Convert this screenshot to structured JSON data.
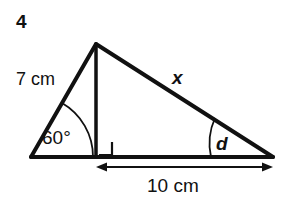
{
  "figure": {
    "question_number": "4",
    "type": "triangle-with-altitude",
    "stroke_color": "#111111",
    "background_color": "#ffffff",
    "labels": {
      "left_side": "7 cm",
      "left_angle": "60°",
      "right_side": "x",
      "right_angle": "d",
      "base_segment": "10 cm"
    },
    "geometry": {
      "left_vertex": [
        31,
        157
      ],
      "apex": [
        96,
        44
      ],
      "right_vertex": [
        273,
        157
      ],
      "foot_of_altitude": [
        96,
        157
      ],
      "right_angle_marker": {
        "x": 97,
        "y": 142,
        "size": 15
      },
      "arc_left_radius": 62,
      "arc_right_radius": 62,
      "dimension_line": {
        "y": 167,
        "x_start": 96,
        "x_end": 273
      }
    }
  }
}
